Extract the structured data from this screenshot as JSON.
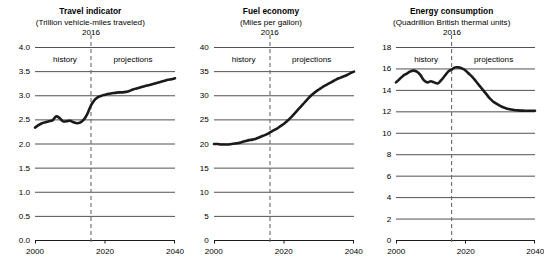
{
  "chart_data": [
    {
      "type": "line",
      "title": "Travel indicator",
      "subtitle": "(Trillion vehicle-miles traveled)",
      "ylabel": "Trillion vehicle-miles traveled",
      "xlabel": "",
      "xlim": [
        2000,
        2040
      ],
      "ylim": [
        0.0,
        4.0
      ],
      "yticks": [
        "0.0",
        "0.5",
        "1.0",
        "1.5",
        "2.0",
        "2.5",
        "3.0",
        "3.5",
        "4.0"
      ],
      "ytick_values": [
        0.0,
        0.5,
        1.0,
        1.5,
        2.0,
        2.5,
        3.0,
        3.5,
        4.0
      ],
      "xticks": [
        "2000",
        "2020",
        "2040"
      ],
      "xtick_values": [
        2000,
        2020,
        2040
      ],
      "grid": true,
      "legend": "none",
      "divider_year": 2016,
      "divider_label": "2016",
      "annotations": [
        "history",
        "projections"
      ],
      "history_label": "history",
      "projections_label": "projections",
      "x": [
        2000,
        2001,
        2002,
        2003,
        2004,
        2005,
        2006,
        2007,
        2008,
        2009,
        2010,
        2011,
        2012,
        2013,
        2014,
        2015,
        2016,
        2017,
        2018,
        2019,
        2020,
        2021,
        2022,
        2023,
        2024,
        2025,
        2026,
        2027,
        2028,
        2029,
        2030,
        2031,
        2032,
        2033,
        2034,
        2035,
        2036,
        2037,
        2038,
        2039,
        2040
      ],
      "values": [
        2.33,
        2.38,
        2.42,
        2.44,
        2.46,
        2.48,
        2.56,
        2.53,
        2.46,
        2.46,
        2.47,
        2.44,
        2.42,
        2.44,
        2.5,
        2.62,
        2.79,
        2.9,
        2.96,
        2.99,
        3.01,
        3.03,
        3.04,
        3.05,
        3.06,
        3.06,
        3.07,
        3.09,
        3.12,
        3.14,
        3.16,
        3.18,
        3.2,
        3.22,
        3.24,
        3.26,
        3.28,
        3.3,
        3.32,
        3.33,
        3.35
      ]
    },
    {
      "type": "line",
      "title": "Fuel economy",
      "subtitle": "(Miles per gallon)",
      "ylabel": "Miles per gallon",
      "xlabel": "",
      "xlim": [
        2000,
        2040
      ],
      "ylim": [
        0,
        40
      ],
      "yticks": [
        "0",
        "5",
        "10",
        "15",
        "20",
        "25",
        "30",
        "35",
        "40"
      ],
      "ytick_values": [
        0,
        5,
        10,
        15,
        20,
        25,
        30,
        35,
        40
      ],
      "xticks": [
        "2000",
        "2020",
        "2040"
      ],
      "xtick_values": [
        2000,
        2020,
        2040
      ],
      "grid": true,
      "legend": "none",
      "divider_year": 2016,
      "divider_label": "2016",
      "annotations": [
        "history",
        "projections"
      ],
      "history_label": "history",
      "projections_label": "projections",
      "x": [
        2000,
        2001,
        2002,
        2003,
        2004,
        2005,
        2006,
        2007,
        2008,
        2009,
        2010,
        2011,
        2012,
        2013,
        2014,
        2015,
        2016,
        2017,
        2018,
        2019,
        2020,
        2021,
        2022,
        2023,
        2024,
        2025,
        2026,
        2027,
        2028,
        2029,
        2030,
        2031,
        2032,
        2033,
        2034,
        2035,
        2036,
        2037,
        2038,
        2039,
        2040
      ],
      "values": [
        19.9,
        19.9,
        19.8,
        19.8,
        19.8,
        19.9,
        20.0,
        20.1,
        20.3,
        20.5,
        20.7,
        20.8,
        21.0,
        21.3,
        21.6,
        21.9,
        22.3,
        22.7,
        23.1,
        23.6,
        24.1,
        24.7,
        25.4,
        26.2,
        27.0,
        27.8,
        28.6,
        29.4,
        30.1,
        30.7,
        31.2,
        31.7,
        32.1,
        32.5,
        32.9,
        33.3,
        33.6,
        33.9,
        34.2,
        34.6,
        34.9
      ]
    },
    {
      "type": "line",
      "title": "Energy consumption",
      "subtitle": "(Quadrillion British thermal units)",
      "ylabel": "Quadrillion British thermal units",
      "xlabel": "",
      "xlim": [
        2000,
        2040
      ],
      "ylim": [
        0,
        18
      ],
      "yticks": [
        "0",
        "2",
        "4",
        "6",
        "8",
        "10",
        "12",
        "14",
        "16",
        "18"
      ],
      "ytick_values": [
        0,
        2,
        4,
        6,
        8,
        10,
        12,
        14,
        16,
        18
      ],
      "xticks": [
        "2000",
        "2020",
        "2040"
      ],
      "xtick_values": [
        2000,
        2020,
        2040
      ],
      "grid": true,
      "legend": "none",
      "divider_year": 2016,
      "divider_label": "2016",
      "annotations": [
        "history",
        "projections"
      ],
      "history_label": "history",
      "projections_label": "projections",
      "x": [
        2000,
        2001,
        2002,
        2003,
        2004,
        2005,
        2006,
        2007,
        2008,
        2009,
        2010,
        2011,
        2012,
        2013,
        2014,
        2015,
        2016,
        2017,
        2018,
        2019,
        2020,
        2021,
        2022,
        2023,
        2024,
        2025,
        2026,
        2027,
        2028,
        2029,
        2030,
        2031,
        2032,
        2033,
        2034,
        2035,
        2036,
        2037,
        2038,
        2039,
        2040
      ],
      "values": [
        14.7,
        15.0,
        15.3,
        15.5,
        15.7,
        15.8,
        15.7,
        15.4,
        14.9,
        14.7,
        14.8,
        14.7,
        14.6,
        14.9,
        15.3,
        15.7,
        15.9,
        16.1,
        16.1,
        16.0,
        15.8,
        15.5,
        15.2,
        14.8,
        14.4,
        14.0,
        13.6,
        13.2,
        12.9,
        12.7,
        12.5,
        12.35,
        12.25,
        12.18,
        12.12,
        12.09,
        12.07,
        12.06,
        12.05,
        12.05,
        12.05
      ]
    }
  ],
  "style": {
    "line_color": "#1a1a1a",
    "grid_color": "#3d3d3d",
    "axis_color": "#1a1a1a",
    "divider_color": "#6b6b6b",
    "background": "#ffffff"
  }
}
